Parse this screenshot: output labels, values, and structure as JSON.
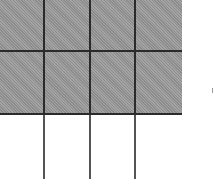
{
  "diagram": {
    "type": "fraction-grid",
    "columns": 4,
    "rows": 3,
    "shaded_rows": 2,
    "shaded_cells": 8,
    "total_cells": 12,
    "colors": {
      "shaded": "#9c9c9c",
      "unshaded": "#ffffff",
      "lines": "#2a2a2a"
    },
    "cells": [
      [
        "shaded",
        "shaded",
        "shaded",
        "shaded"
      ],
      [
        "shaded",
        "shaded",
        "shaded",
        "shaded"
      ],
      [
        "white",
        "white",
        "white",
        "white"
      ]
    ]
  }
}
